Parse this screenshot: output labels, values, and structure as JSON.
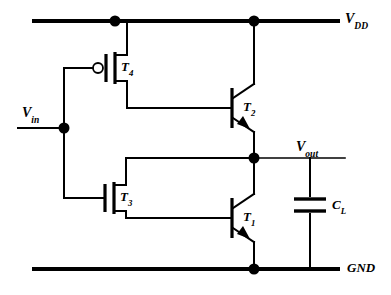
{
  "diagram": {
    "type": "circuit-schematic",
    "line_color": "#000000",
    "background_color": "#ffffff"
  },
  "labels": {
    "vdd": {
      "base": "V",
      "sub": "DD"
    },
    "vin": {
      "base": "V",
      "sub": "in"
    },
    "vout": {
      "base": "V",
      "sub": "out"
    },
    "gnd": {
      "text": "GND"
    }
  },
  "components": [
    {
      "id": "T4",
      "base": "T",
      "sub": "4",
      "type": "PMOS",
      "note": "gate bubble, source to VDD"
    },
    {
      "id": "T3",
      "base": "T",
      "sub": "3",
      "type": "NMOS",
      "note": "gate plain, drain to Vout node"
    },
    {
      "id": "T2",
      "base": "T",
      "sub": "2",
      "type": "NPN",
      "note": "collector to VDD, emitter to Vout node"
    },
    {
      "id": "T1",
      "base": "T",
      "sub": "1",
      "type": "NPN",
      "note": "collector to Vout node, emitter to GND"
    },
    {
      "id": "CL",
      "base": "C",
      "sub": "L",
      "type": "capacitor",
      "note": "load capacitor between Vout and GND"
    }
  ],
  "nodes": [
    {
      "name": "vdd-tap-left",
      "x": 115,
      "y": 21
    },
    {
      "name": "vdd-tap-right",
      "x": 254,
      "y": 21
    },
    {
      "name": "vin-junction",
      "x": 64,
      "y": 128
    },
    {
      "name": "vout-junction",
      "x": 254,
      "y": 158
    },
    {
      "name": "gnd-junction",
      "x": 254,
      "y": 269
    }
  ]
}
